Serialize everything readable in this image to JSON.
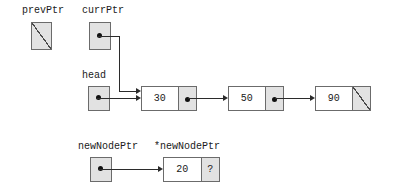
{
  "diagram": {
    "type": "linked-list-pointer-diagram",
    "colors": {
      "background": "#ffffff",
      "box_fill": "#e2e2e2",
      "node_data_fill": "#ffffff",
      "border": "#6b6b6b",
      "line": "#2b2b2b",
      "text": "#1a1a1a"
    }
  },
  "labels": {
    "prev_ptr": "prevPtr",
    "curr_ptr": "currPtr",
    "head": "head",
    "new_node_ptr": "newNodePtr",
    "deref_new_node_ptr": "*newNodePtr"
  },
  "pointers": {
    "prev_ptr": {
      "name": "prevPtr",
      "value": "null"
    },
    "curr_ptr": {
      "name": "currPtr",
      "value": "pointer"
    },
    "head": {
      "name": "head",
      "value": "pointer"
    },
    "new_node_ptr": {
      "name": "newNodePtr",
      "value": "pointer"
    }
  },
  "list": {
    "nodes": [
      {
        "data": "30",
        "link": "pointer"
      },
      {
        "data": "50",
        "link": "pointer"
      },
      {
        "data": "90",
        "link": "null"
      }
    ]
  },
  "new_node": {
    "data": "20",
    "link": "?"
  }
}
